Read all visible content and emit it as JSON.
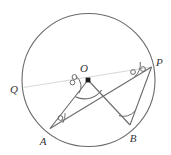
{
  "figure": {
    "background_color": "#ffffff",
    "stroke_color": "#6b6b6b",
    "faint_stroke_color": "#d8d8d8",
    "label_color": "#333333",
    "width": 171,
    "height": 155
  },
  "circle": {
    "name": "main-circle",
    "cx": 88.5,
    "cy": 80,
    "r": 66.5,
    "stroke": "#6b6b6b",
    "stroke_width": 1.1,
    "fill": "none"
  },
  "points": [
    {
      "id": "O",
      "label": "O",
      "x": 88.0,
      "y": 80.0,
      "label_x": 84.0,
      "label_y": 72.0,
      "marker": "filled-dot",
      "on_circle": false
    },
    {
      "id": "P",
      "label": "P",
      "x": 151.5,
      "y": 67.0,
      "label_x": 156.0,
      "label_y": 66.0,
      "marker": "none",
      "on_circle": true
    },
    {
      "id": "Q",
      "label": "Q",
      "x": 23.5,
      "y": 87.5,
      "label_x": 10.0,
      "label_y": 93.0,
      "marker": "none",
      "on_circle": true
    },
    {
      "id": "A",
      "label": "A",
      "x": 50.0,
      "y": 128.5,
      "label_x": 43.0,
      "label_y": 145.0,
      "marker": "none",
      "on_circle": true
    },
    {
      "id": "B",
      "label": "B",
      "x": 130.0,
      "y": 125.0,
      "label_x": 133.0,
      "label_y": 142.0,
      "marker": "none",
      "on_circle": true
    }
  ],
  "segments": [
    {
      "id": "OA",
      "from": "O",
      "to": "A",
      "x1": 88.0,
      "y1": 80.0,
      "x2": 50.0,
      "y2": 128.5,
      "stroke": "#6b6b6b",
      "stroke_width": 1.1,
      "style": "solid"
    },
    {
      "id": "OB",
      "from": "O",
      "to": "B",
      "x1": 88.0,
      "y1": 80.0,
      "x2": 130.0,
      "y2": 125.0,
      "stroke": "#6b6b6b",
      "stroke_width": 1.1,
      "style": "solid"
    },
    {
      "id": "AP",
      "from": "A",
      "to": "P",
      "x1": 50.0,
      "y1": 128.5,
      "x2": 151.5,
      "y2": 67.0,
      "stroke": "#6b6b6b",
      "stroke_width": 1.1,
      "style": "solid"
    },
    {
      "id": "BP",
      "from": "B",
      "to": "P",
      "x1": 130.0,
      "y1": 125.0,
      "x2": 151.5,
      "y2": 67.0,
      "stroke": "#6b6b6b",
      "stroke_width": 1.1,
      "style": "solid"
    },
    {
      "id": "QP",
      "from": "Q",
      "to": "P",
      "x1": 23.5,
      "y1": 87.5,
      "x2": 151.5,
      "y2": 67.0,
      "stroke": "#d8d8d8",
      "stroke_width": 1.1,
      "style": "solid"
    }
  ],
  "angle_marks": [
    {
      "id": "angle-at-O-interior",
      "vertex": "O",
      "type": "arc",
      "note": "arc spanning angle AOB at center"
    },
    {
      "id": "angle-at-O-upper",
      "vertex": "O",
      "type": "arc",
      "note": "small arc toward Q direction"
    },
    {
      "id": "angle-at-A",
      "vertex": "A",
      "type": "arc-with-circle-tick",
      "note": "angle OAP marked with arc and small circle"
    },
    {
      "id": "angle-at-B",
      "vertex": "B",
      "type": "arc",
      "note": "angle OBP marked with arc"
    },
    {
      "id": "angle-at-P",
      "vertex": "P",
      "type": "arc-with-circle-tick",
      "note": "angle APB / QPA marked with arc and small circle"
    }
  ],
  "tick_circles": [
    {
      "id": "tick-O-1",
      "x": 74.5,
      "y": 77.0,
      "r": 2.4
    },
    {
      "id": "tick-O-2",
      "x": 72.5,
      "y": 82.5,
      "r": 2.4
    },
    {
      "id": "tick-A-1",
      "x": 60.5,
      "y": 118.0,
      "r": 2.4
    },
    {
      "id": "tick-P-1",
      "x": 133.0,
      "y": 72.0,
      "r": 2.4
    },
    {
      "id": "tick-P-2",
      "x": 143.0,
      "y": 69.0,
      "r": 2.4
    }
  ]
}
